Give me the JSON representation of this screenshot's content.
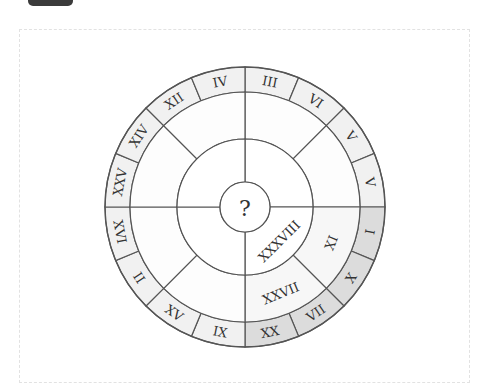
{
  "header": {
    "badge_label": ""
  },
  "puzzle": {
    "center_label": "?",
    "outer_ring": [
      {
        "label": "III",
        "angle": 11.25,
        "shade": "light"
      },
      {
        "label": "VI",
        "angle": 33.75,
        "shade": "light"
      },
      {
        "label": "V",
        "angle": 56.25,
        "shade": "light"
      },
      {
        "label": "V",
        "angle": 78.75,
        "shade": "light"
      },
      {
        "label": "I",
        "angle": 101.25,
        "shade": "dark"
      },
      {
        "label": "X",
        "angle": 123.75,
        "shade": "dark"
      },
      {
        "label": "VII",
        "angle": 146.25,
        "shade": "dark"
      },
      {
        "label": "XX",
        "angle": 168.75,
        "shade": "dark"
      },
      {
        "label": "IX",
        "angle": 191.25,
        "shade": "light"
      },
      {
        "label": "XV",
        "angle": 213.75,
        "shade": "light"
      },
      {
        "label": "II",
        "angle": 236.25,
        "shade": "light"
      },
      {
        "label": "XVI",
        "angle": 258.75,
        "shade": "light"
      },
      {
        "label": "XXV",
        "angle": 281.25,
        "shade": "light"
      },
      {
        "label": "XIV",
        "angle": 303.75,
        "shade": "light"
      },
      {
        "label": "XII",
        "angle": 326.25,
        "shade": "light"
      },
      {
        "label": "IV",
        "angle": 348.75,
        "shade": "light"
      }
    ],
    "middle_ring": [
      {
        "label": "XI",
        "angle": 112.5
      },
      {
        "label": "XXVII",
        "angle": 157.5
      }
    ],
    "inner_ring": [
      {
        "label": "XXXVIII",
        "angle": 135
      }
    ],
    "colors": {
      "outer_light": "#f1f1f1",
      "outer_dark": "#dcdcdc",
      "middle_shade": "#f7f7f7",
      "stroke": "#555555"
    }
  }
}
